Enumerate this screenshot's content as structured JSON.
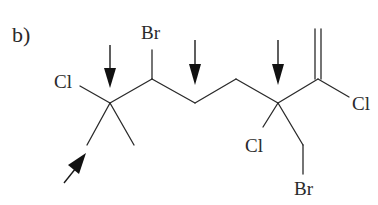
{
  "figure": {
    "panel_label": "b)",
    "colors": {
      "bond": "#2a2a2a",
      "arrow": "#111111",
      "background": "#ffffff"
    }
  },
  "atoms": {
    "cl_left": "Cl",
    "br_top": "Br",
    "cl_right": "Cl",
    "cl_lower": "Cl",
    "br_bottom": "Br"
  },
  "arrows": [
    {
      "id": "arrow-1",
      "direction": "down",
      "target": "quaternary-carbon-left"
    },
    {
      "id": "arrow-2",
      "direction": "down",
      "target": "methylene-carbon"
    },
    {
      "id": "arrow-3",
      "direction": "down",
      "target": "quaternary-carbon-right"
    },
    {
      "id": "arrow-4",
      "direction": "up-right",
      "target": "methyl-carbon"
    }
  ]
}
